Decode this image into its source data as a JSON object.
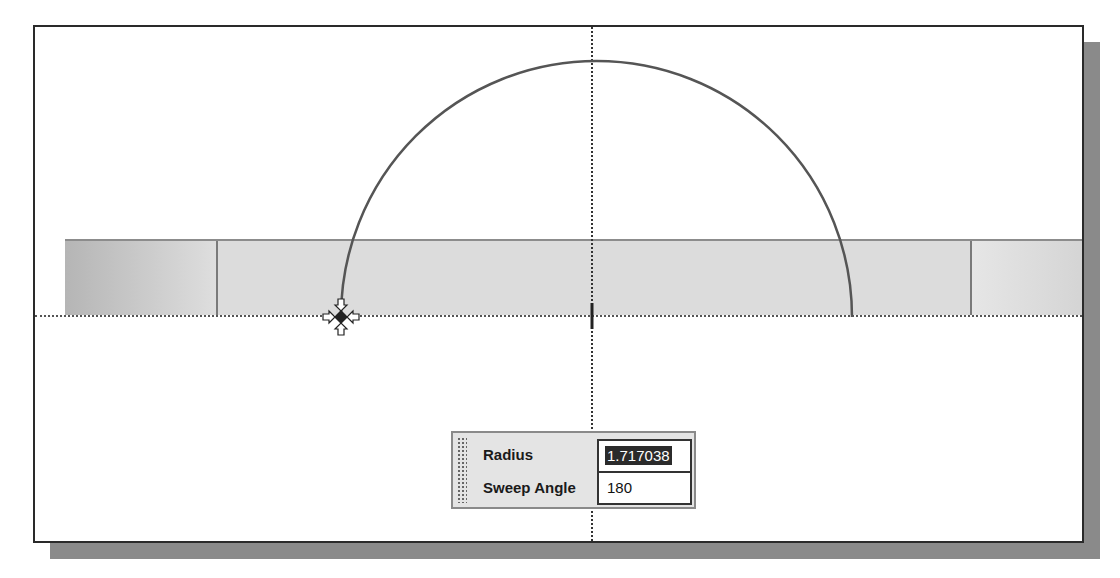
{
  "canvas": {
    "background": "#ffffff",
    "frame_border_color": "#2a2a2a",
    "shadow_color": "#8a8a8a",
    "arc": {
      "type": "semicircle",
      "center_px": [
        591,
        315
      ],
      "start_px": [
        339,
        315
      ],
      "end_px": [
        850,
        315
      ],
      "color": "#555555"
    },
    "cursor_icon": "snap-endpoint-icon",
    "center_marker_icon": "center-tick-icon"
  },
  "input_panel": {
    "fields": [
      {
        "label": "Radius",
        "value": "1.717038",
        "selected": true
      },
      {
        "label": "Sweep Angle",
        "value": "180",
        "selected": false
      }
    ]
  }
}
